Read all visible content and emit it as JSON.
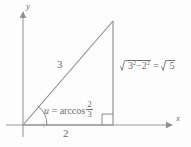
{
  "figure": {
    "name": "right-triangle-arccos-diagram",
    "background_color": "#fdfdfd",
    "line_color": "#8a8a8a",
    "text_color": "#6f6f6f"
  },
  "axes": {
    "x_label": "x",
    "y_label": "y"
  },
  "labels": {
    "base_length": "2",
    "hypotenuse_length": "3",
    "angle_variable": "u",
    "angle_equals": "=",
    "angle_function": "arccos",
    "angle_fraction_numerator": "2",
    "angle_fraction_denominator": "3",
    "height_radicand_first_base": "3",
    "height_radicand_first_exponent": "2",
    "height_radicand_minus": "−",
    "height_radicand_second_base": "2",
    "height_radicand_second_exponent": "2",
    "height_equals": "=",
    "height_result_radicand": "5"
  },
  "geometry": {
    "origin": {
      "x": 23,
      "y": 125
    },
    "apex": {
      "x": 113,
      "y": 21
    },
    "base_right": {
      "x": 113,
      "y": 125
    },
    "x_axis_end": {
      "x": 170,
      "y": 125
    },
    "y_axis_top": {
      "x": 23,
      "y": 14
    },
    "right_angle_marker_size": 11,
    "angle_arc_radius": 24
  }
}
